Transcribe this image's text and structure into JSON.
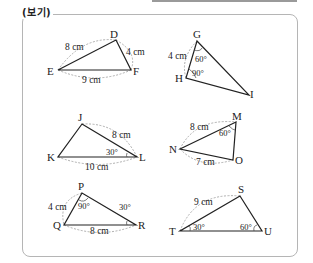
{
  "header": {
    "label": "(보기)"
  },
  "colors": {
    "line": "#222222",
    "dash": "#9a9a9a",
    "border": "#b5b5b5",
    "topbar": "#9a9a9a"
  },
  "triangles": [
    {
      "name": "DEF",
      "vertices": {
        "D": "D",
        "E": "E",
        "F": "F"
      },
      "labels": {
        "ED": "8 cm",
        "DF": "4 cm",
        "EF": "9 cm"
      }
    },
    {
      "name": "GHI",
      "vertices": {
        "G": "G",
        "H": "H",
        "I": "I"
      },
      "labels": {
        "GH": "4 cm",
        "angG": "60°",
        "angH": "90°"
      }
    },
    {
      "name": "JKL",
      "vertices": {
        "J": "J",
        "K": "K",
        "L": "L"
      },
      "labels": {
        "JL": "8 cm",
        "KL": "10 cm",
        "angL": "30°"
      }
    },
    {
      "name": "MNO",
      "vertices": {
        "M": "M",
        "N": "N",
        "O": "O"
      },
      "labels": {
        "NM": "8 cm",
        "NO": "7 cm",
        "angM": "60°"
      }
    },
    {
      "name": "PQR",
      "vertices": {
        "P": "P",
        "Q": "Q",
        "R": "R"
      },
      "labels": {
        "PQ": "4 cm",
        "QR": "8 cm",
        "angP": "90°",
        "angR": "30°"
      }
    },
    {
      "name": "STU",
      "vertices": {
        "S": "S",
        "T": "T",
        "U": "U"
      },
      "labels": {
        "TS": "9 cm",
        "angT": "30°",
        "angU": "60°"
      }
    }
  ]
}
